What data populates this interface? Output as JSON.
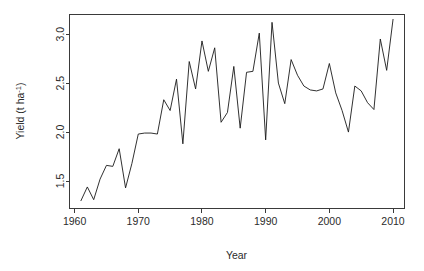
{
  "chart_data": {
    "type": "line",
    "title": "",
    "xlabel": "Year",
    "ylabel": "Yield (t ha-1)",
    "ylabel_parts": {
      "main": "Yield (t ha",
      "superscript": "-1",
      "tail": ")"
    },
    "grid": false,
    "legend": null,
    "xlim": [
      1959.2,
      2011.8
    ],
    "ylim": [
      1.22,
      3.2
    ],
    "xticks": [
      1960,
      1970,
      1980,
      1990,
      2000,
      2010
    ],
    "xtick_labels": [
      "1960",
      "1970",
      "1980",
      "1990",
      "2000",
      "2010"
    ],
    "yticks": [
      1.5,
      2.0,
      2.5,
      3.0
    ],
    "ytick_labels": [
      "1.5",
      "2.0",
      "2.5",
      "3.0"
    ],
    "line_color": "#1a1a1a",
    "axis_color": "#3a3a3a",
    "series": [
      {
        "name": "Yield",
        "x": [
          1961,
          1962,
          1963,
          1964,
          1965,
          1966,
          1967,
          1968,
          1969,
          1970,
          1971,
          1972,
          1973,
          1974,
          1975,
          1976,
          1977,
          1978,
          1979,
          1980,
          1981,
          1982,
          1983,
          1984,
          1985,
          1986,
          1987,
          1988,
          1989,
          1990,
          1991,
          1992,
          1993,
          1994,
          1995,
          1996,
          1997,
          1998,
          1999,
          2000,
          2001,
          2002,
          2003,
          2004,
          2005,
          2006,
          2007,
          2008,
          2009,
          2010
        ],
        "values": [
          1.3,
          1.44,
          1.31,
          1.52,
          1.66,
          1.65,
          1.83,
          1.43,
          1.68,
          1.98,
          1.99,
          1.99,
          1.98,
          2.33,
          2.22,
          2.54,
          1.88,
          2.72,
          2.44,
          2.93,
          2.62,
          2.86,
          2.1,
          2.2,
          2.67,
          2.04,
          2.61,
          2.62,
          3.01,
          1.92,
          3.12,
          2.5,
          2.29,
          2.74,
          2.58,
          2.47,
          2.43,
          2.42,
          2.44,
          2.7,
          2.4,
          2.22,
          2.0,
          2.47,
          2.42,
          2.3,
          2.23,
          2.95,
          2.63,
          3.15
        ]
      }
    ]
  },
  "axes": {
    "x_title": "Year",
    "y_title_main": "Yield (t ha",
    "y_title_sup": "-1",
    "y_title_tail": ")"
  }
}
